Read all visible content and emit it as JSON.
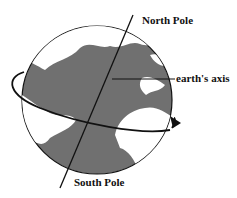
{
  "diagram": {
    "labels": {
      "north": "North Pole",
      "axis": "earth's axis",
      "south": "South Pole"
    },
    "colors": {
      "ocean": "#707070",
      "land": "#ffffff",
      "outline": "#111111"
    }
  }
}
